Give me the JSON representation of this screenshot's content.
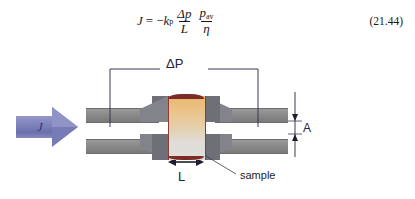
{
  "equation": {
    "lhs": "J",
    "equals": "=",
    "minus": "−",
    "coefficient": "k",
    "coefficient_sub": "p",
    "frac1_num": "Δp",
    "frac1_den": "L",
    "frac2_num": "p",
    "frac2_num_sub": "av",
    "frac2_den": "η",
    "number": "(21.44)",
    "plain_text": "J = −kₚ (Δp/L)(p_av/η)"
  },
  "figure": {
    "flux_arrow_label": "J",
    "pressure_drop_label": "ΔP",
    "area_label": "A",
    "length_label": "L",
    "sample_label": "sample",
    "colors": {
      "arrow_fill": "#7f83bb",
      "arrow_label": "#32357a",
      "pipe_wall": "#8a8a8a",
      "holder": "#7c7c84",
      "sample_top_band": "#7d2b24",
      "sample_gradient_start": "#e8b56e",
      "sample_gradient_end": "#dfe0dd",
      "annotation_line": "#3a3a55",
      "label_text": "#23233c"
    }
  }
}
